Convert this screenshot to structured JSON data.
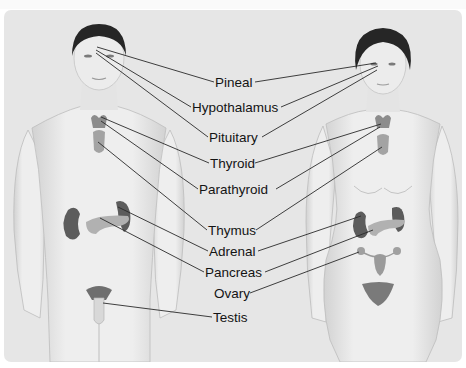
{
  "figure": {
    "background_color": "#e6e6e6",
    "label_color": "#141414",
    "line_color": "#2a2a2a",
    "skin_color": "#e9e9e9",
    "gland_color": "#8a8a8a",
    "figures": [
      "male",
      "female"
    ],
    "labels": [
      {
        "id": "pineal",
        "text": "Pineal",
        "x": 215,
        "y": 76,
        "targets": [
          "male-head",
          "female-head"
        ]
      },
      {
        "id": "hypothalamus",
        "text": "Hypothalamus",
        "x": 192,
        "y": 101,
        "targets": [
          "male-head",
          "female-head"
        ]
      },
      {
        "id": "pituitary",
        "text": "Pituitary",
        "x": 209,
        "y": 131,
        "targets": [
          "male-head",
          "female-head"
        ]
      },
      {
        "id": "thyroid",
        "text": "Thyroid",
        "x": 210,
        "y": 157,
        "targets": [
          "male-neck",
          "female-neck"
        ]
      },
      {
        "id": "parathyroid",
        "text": "Parathyroid",
        "x": 199,
        "y": 183,
        "targets": [
          "male-neck",
          "female-neck"
        ]
      },
      {
        "id": "thymus",
        "text": "Thymus",
        "x": 208,
        "y": 224,
        "targets": [
          "male-chest",
          "female-chest"
        ]
      },
      {
        "id": "adrenal",
        "text": "Adrenal",
        "x": 209,
        "y": 245,
        "targets": [
          "male-kidney",
          "female-kidney"
        ]
      },
      {
        "id": "pancreas",
        "text": "Pancreas",
        "x": 205,
        "y": 266,
        "targets": [
          "male-pancreas",
          "female-pancreas"
        ]
      },
      {
        "id": "ovary",
        "text": "Ovary",
        "x": 214,
        "y": 287,
        "targets": [
          "female-ovary"
        ]
      },
      {
        "id": "testis",
        "text": "Testis",
        "x": 213,
        "y": 311,
        "targets": [
          "male-testis"
        ]
      }
    ]
  }
}
